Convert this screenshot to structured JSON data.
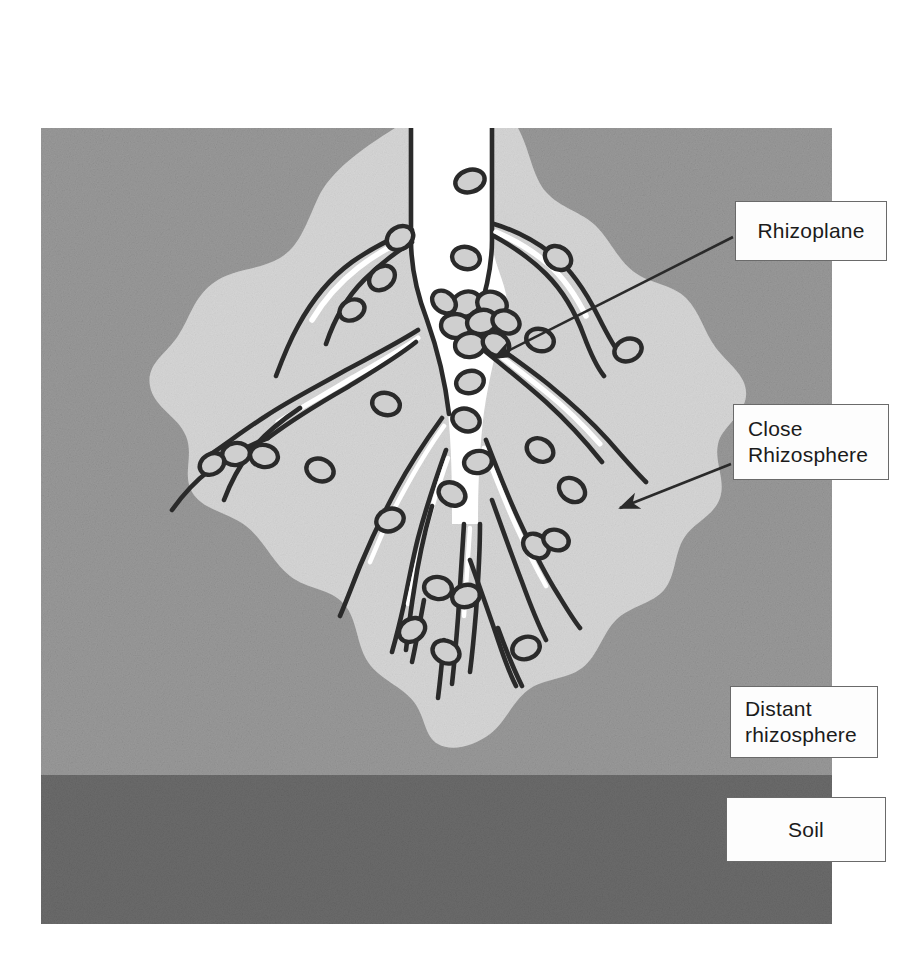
{
  "figure": {
    "background_color": "#ffffff"
  },
  "zones": [
    {
      "id": "soil",
      "label": "Soil",
      "label_lines": [
        "Soil"
      ],
      "color": "#6f6f6f",
      "description": "Bulk soil band at the bottom of the frame"
    },
    {
      "id": "distant-rhizosphere",
      "label": "Distant rhizosphere",
      "label_lines": [
        "Distant",
        "rhizosphere"
      ],
      "color": "#9a9a9a",
      "description": "Outer medium-grey field surrounding the root"
    },
    {
      "id": "close-rhizosphere",
      "label": "Close Rhizosphere",
      "label_lines": [
        "Close",
        "Rhizosphere"
      ],
      "color": "#d5d5d5",
      "description": "Light irregular blob hugging the root and root hairs"
    },
    {
      "id": "rhizoplane",
      "label": "Rhizoplane",
      "label_lines": [
        "Rhizoplane"
      ],
      "color": "#ffffff",
      "description": "Root surface itself where bacteria colonise densely"
    }
  ],
  "elements": {
    "root_color": "#ffffff",
    "ink_color": "#2a2a2a",
    "bacteria_count": 34,
    "bacteria_description": "Small dark-outlined ellipses representing bacterial cells on and near the root surface",
    "root_description": "Central taproot entering from the top with branching lateral roots and fine root hairs"
  },
  "frame": {
    "x": 41,
    "y": 128,
    "width": 791,
    "height": 796,
    "soil_band_top": 775
  },
  "arrows": [
    {
      "from": "box-rhizoplane",
      "to": "rhizoplane",
      "label": "Rhizoplane"
    },
    {
      "from": "box-close",
      "to": "close-rhizosphere",
      "label": "Close Rhizosphere"
    }
  ]
}
